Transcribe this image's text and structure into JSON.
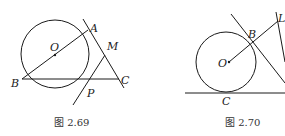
{
  "figures": [
    {
      "id": "fig-2-69",
      "caption": "图 2.69",
      "points": {
        "O": "O",
        "A": "A",
        "M": "M",
        "B": "B",
        "C": "C",
        "P": "P"
      },
      "description": "Circle with center O; diameter BA; secant line BC; tangents at A and P meeting at M; line AC."
    },
    {
      "id": "fig-2-70",
      "caption": "图 2.70",
      "points": {
        "O": "O",
        "B": "B",
        "L": "L",
        "C": "C"
      },
      "description": "Circle with center O tangent to horizontal line at C; tangent line at B; ray OB extended to L."
    }
  ]
}
